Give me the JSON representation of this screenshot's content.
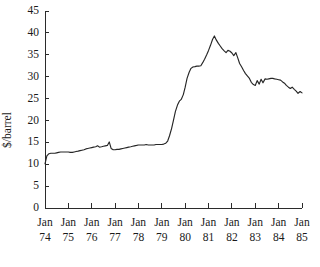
{
  "chart_data": {
    "type": "line",
    "title": "",
    "xlabel": "",
    "ylabel": "$/barrel",
    "ylim": [
      0,
      45
    ],
    "xlim": [
      "Jan 74",
      "Jan 85"
    ],
    "grid": false,
    "legend": "none",
    "y_ticks": [
      0,
      5,
      10,
      15,
      20,
      25,
      30,
      35,
      40,
      45
    ],
    "y_tick_labels": [
      "0",
      "5",
      "10",
      "15",
      "20",
      "25",
      "30",
      "35",
      "40",
      "45"
    ],
    "x_tick_month_label": "Jan",
    "x_tick_years": [
      "74",
      "75",
      "76",
      "77",
      "78",
      "79",
      "80",
      "81",
      "82",
      "83",
      "84",
      "85"
    ],
    "x_tick_labels": [
      "Jan 74",
      "Jan 75",
      "Jan 76",
      "Jan 77",
      "Jan 78",
      "Jan 79",
      "Jan 80",
      "Jan 81",
      "Jan 82",
      "Jan 83",
      "Jan 84",
      "Jan 85"
    ],
    "series": [
      {
        "name": "Crude oil price",
        "x": [
          1974.0,
          1974.08,
          1974.17,
          1974.25,
          1974.33,
          1974.42,
          1974.5,
          1974.58,
          1974.67,
          1974.75,
          1974.83,
          1974.92,
          1975.0,
          1975.08,
          1975.17,
          1975.25,
          1975.33,
          1975.42,
          1975.5,
          1975.58,
          1975.67,
          1975.75,
          1975.83,
          1975.92,
          1976.0,
          1976.08,
          1976.17,
          1976.25,
          1976.33,
          1976.42,
          1976.5,
          1976.58,
          1976.67,
          1976.75,
          1976.83,
          1976.92,
          1977.0,
          1977.08,
          1977.17,
          1977.25,
          1977.33,
          1977.42,
          1977.5,
          1977.58,
          1977.67,
          1977.75,
          1977.83,
          1977.92,
          1978.0,
          1978.08,
          1978.17,
          1978.25,
          1978.33,
          1978.42,
          1978.5,
          1978.58,
          1978.67,
          1978.75,
          1978.83,
          1978.92,
          1979.0,
          1979.08,
          1979.17,
          1979.25,
          1979.33,
          1979.42,
          1979.5,
          1979.58,
          1979.67,
          1979.75,
          1979.83,
          1979.92,
          1980.0,
          1980.08,
          1980.17,
          1980.25,
          1980.33,
          1980.42,
          1980.5,
          1980.58,
          1980.67,
          1980.75,
          1980.83,
          1980.92,
          1981.0,
          1981.08,
          1981.17,
          1981.25,
          1981.33,
          1981.42,
          1981.5,
          1981.58,
          1981.67,
          1981.75,
          1981.83,
          1981.92,
          1982.0,
          1982.08,
          1982.17,
          1982.25,
          1982.33,
          1982.42,
          1982.5,
          1982.58,
          1982.67,
          1982.75,
          1982.83,
          1982.92,
          1983.0,
          1983.08,
          1983.17,
          1983.25,
          1983.33,
          1983.42,
          1983.5,
          1983.58,
          1983.67,
          1983.75,
          1983.83,
          1983.92,
          1984.0,
          1984.08,
          1984.17,
          1984.25,
          1984.33,
          1984.42,
          1984.5,
          1984.58,
          1984.67,
          1984.75,
          1984.83,
          1984.92,
          1985.0
        ],
        "values": [
          10.1,
          11.9,
          12.4,
          12.5,
          12.5,
          12.5,
          12.6,
          12.7,
          12.8,
          12.8,
          12.8,
          12.8,
          12.8,
          12.7,
          12.7,
          12.8,
          12.9,
          13.0,
          13.1,
          13.2,
          13.3,
          13.5,
          13.6,
          13.7,
          13.8,
          13.9,
          14.0,
          14.2,
          13.9,
          14.0,
          14.1,
          14.2,
          14.3,
          15.1,
          13.6,
          13.3,
          13.3,
          13.4,
          13.4,
          13.5,
          13.6,
          13.7,
          13.8,
          13.9,
          14.0,
          14.1,
          14.2,
          14.3,
          14.4,
          14.4,
          14.4,
          14.4,
          14.5,
          14.4,
          14.4,
          14.4,
          14.4,
          14.5,
          14.5,
          14.5,
          14.5,
          14.6,
          14.8,
          15.3,
          16.5,
          18.2,
          20.1,
          22.0,
          23.5,
          24.4,
          24.8,
          25.9,
          27.6,
          29.6,
          31.0,
          31.9,
          32.2,
          32.3,
          32.4,
          32.4,
          32.5,
          33.2,
          34.0,
          35.0,
          36.0,
          37.1,
          38.5,
          39.3,
          38.4,
          37.6,
          37.0,
          36.4,
          35.9,
          35.5,
          36.0,
          35.8,
          35.4,
          34.8,
          35.5,
          34.3,
          33.0,
          32.2,
          31.4,
          30.7,
          30.1,
          29.6,
          28.7,
          28.2,
          28.0,
          29.1,
          28.3,
          29.4,
          28.6,
          29.5,
          29.4,
          29.5,
          29.6,
          29.6,
          29.5,
          29.4,
          29.3,
          29.2,
          28.8,
          28.5,
          28.0,
          27.6,
          27.3,
          27.6,
          27.1,
          26.7,
          26.2,
          26.6,
          26.3
        ]
      }
    ],
    "note": "Monthly crude oil price in US dollars per barrel, January 1974 through January 1985."
  }
}
